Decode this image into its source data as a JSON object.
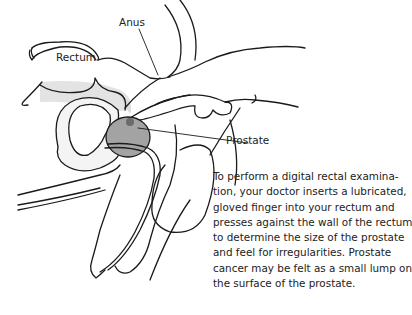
{
  "figure": {
    "labels": {
      "anus": "Anus",
      "rectum": "Rectum",
      "prostate": "Prostate"
    },
    "caption_lines": [
      "To perform a digital rectal examina-",
      "tion, your doctor inserts a lubricated,",
      "gloved finger into your rectum and",
      "presses against the wall of the rectum",
      "to determine the size of the prostate",
      "and feel for irregularities. Prostate",
      "cancer may be felt as a small lump on",
      "the surface of the prostate."
    ],
    "colors": {
      "line": "#1a1a1a",
      "prostate_fill": "#9e9e9e",
      "tissue_shade": "#d9d9d9",
      "lump": "#6b6b6b"
    }
  }
}
